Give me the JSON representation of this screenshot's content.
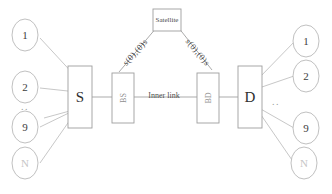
{
  "diagram": {
    "colors": {
      "edge": "#b9b9b9",
      "node_stroke": "#b0b0b0",
      "box_stroke": "#9e9e9e",
      "text": "#3d3d3d",
      "background": "#ffffff"
    },
    "satellite": {
      "label": "Satellite"
    },
    "hubs": {
      "source": "S",
      "destination": "D"
    },
    "relays": {
      "left": "BS",
      "right": "BD"
    },
    "links": {
      "inner": "Inner link",
      "uplink": "s(0),(0)s",
      "downlink": "s(0),(0)s"
    },
    "source_nodes": [
      {
        "label": "1"
      },
      {
        "label": "2"
      },
      {
        "label": "9"
      },
      {
        "label": "N"
      }
    ],
    "source_ellipsis": "..",
    "destination_nodes": [
      {
        "label": "1"
      },
      {
        "label": "2"
      },
      {
        "label": "9"
      },
      {
        "label": "N"
      }
    ],
    "destination_ellipsis": ".."
  }
}
